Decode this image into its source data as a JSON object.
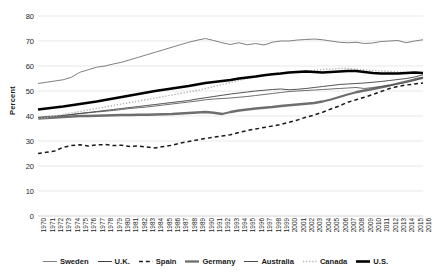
{
  "chart_data": {
    "type": "line",
    "title": "",
    "xlabel": "",
    "ylabel": "Percent",
    "ylim": [
      0,
      80
    ],
    "ytick_step": 10,
    "yticks": [
      0,
      10,
      20,
      30,
      40,
      50,
      60,
      70,
      80
    ],
    "grid": "horizontal",
    "legend_position": "bottom",
    "x": [
      1970,
      1971,
      1972,
      1973,
      1974,
      1975,
      1976,
      1977,
      1978,
      1979,
      1980,
      1981,
      1982,
      1983,
      1984,
      1985,
      1986,
      1987,
      1988,
      1989,
      1990,
      1991,
      1992,
      1993,
      1994,
      1995,
      1996,
      1997,
      1998,
      1999,
      2000,
      2001,
      2002,
      2003,
      2004,
      2005,
      2006,
      2007,
      2008,
      2009,
      2010,
      2011,
      2012,
      2013,
      2014,
      2015,
      2016
    ],
    "categories": [
      "1970",
      "1971",
      "1972",
      "1973",
      "1974",
      "1975",
      "1976",
      "1977",
      "1978",
      "1979",
      "1980",
      "1981",
      "1982",
      "1983",
      "1984",
      "1985",
      "1986",
      "1987",
      "1988",
      "1989",
      "1990",
      "1991",
      "1992",
      "1993",
      "1994",
      "1995",
      "1996",
      "1997",
      "1998",
      "1999",
      "2000",
      "2001",
      "2002",
      "2003",
      "2004",
      "2005",
      "2006",
      "2007",
      "2008",
      "2009",
      "2010",
      "2011",
      "2012",
      "2013",
      "2014",
      "2015",
      "2016"
    ],
    "series": [
      {
        "name": "Sweden",
        "color": "#808080",
        "style": "solid",
        "width": 1,
        "values": [
          53.0,
          53.5,
          54.0,
          54.5,
          55.5,
          57.5,
          58.5,
          59.5,
          60.0,
          60.8,
          61.5,
          62.5,
          63.5,
          64.5,
          65.5,
          66.5,
          67.5,
          68.5,
          69.5,
          70.3,
          71.0,
          70.2,
          69.3,
          68.6,
          69.3,
          68.5,
          69.0,
          68.4,
          69.5,
          70.0,
          70.0,
          70.4,
          70.6,
          70.8,
          70.5,
          70.0,
          69.5,
          69.3,
          69.5,
          69.0,
          69.2,
          69.8,
          70.0,
          70.2,
          69.3,
          70.0,
          70.5
        ]
      },
      {
        "name": "U.K.",
        "color": "#3f3f3f",
        "style": "solid",
        "width": 0.9,
        "values": [
          39.0,
          39.5,
          39.8,
          40.2,
          40.6,
          41.0,
          41.4,
          41.8,
          42.2,
          42.6,
          43.0,
          43.4,
          43.8,
          44.2,
          44.6,
          45.0,
          45.4,
          45.8,
          46.2,
          46.8,
          47.3,
          47.8,
          48.3,
          48.8,
          49.2,
          49.6,
          50.0,
          50.3,
          50.6,
          50.8,
          50.5,
          50.7,
          51.0,
          51.4,
          51.8,
          52.2,
          52.6,
          52.8,
          53.0,
          53.2,
          53.5,
          53.8,
          54.2,
          54.6,
          55.0,
          55.6,
          56.5
        ]
      },
      {
        "name": "Spain",
        "color": "#1a1a1a",
        "style": "dashed",
        "width": 1.5,
        "values": [
          25.0,
          25.5,
          26.0,
          27.5,
          28.2,
          28.5,
          28.0,
          28.4,
          28.6,
          28.2,
          28.3,
          27.8,
          28.0,
          27.6,
          27.2,
          27.8,
          28.3,
          29.2,
          29.8,
          30.4,
          31.0,
          31.5,
          32.0,
          32.5,
          33.4,
          34.2,
          34.8,
          35.4,
          36.0,
          36.6,
          37.5,
          38.4,
          39.5,
          40.4,
          41.5,
          42.8,
          44.0,
          45.5,
          46.5,
          47.5,
          48.6,
          49.8,
          51.0,
          51.8,
          52.4,
          52.8,
          53.2
        ]
      },
      {
        "name": "Germany",
        "color": "#6e6e6e",
        "style": "solid",
        "width": 2.3,
        "values": [
          39.0,
          39.2,
          39.4,
          39.6,
          39.8,
          40.0,
          40.0,
          40.1,
          40.2,
          40.3,
          40.4,
          40.4,
          40.5,
          40.5,
          40.6,
          40.7,
          40.8,
          41.0,
          41.2,
          41.4,
          41.6,
          41.3,
          40.8,
          41.6,
          42.2,
          42.6,
          43.0,
          43.3,
          43.6,
          44.0,
          44.3,
          44.6,
          44.9,
          45.2,
          45.8,
          46.6,
          47.6,
          48.6,
          49.5,
          50.2,
          50.8,
          51.5,
          52.2,
          53.0,
          53.8,
          54.6,
          55.3
        ]
      },
      {
        "name": "Australia",
        "color": "#4a4a4a",
        "style": "solid",
        "width": 0.8,
        "values": [
          39.5,
          39.8,
          40.0,
          40.2,
          40.6,
          41.0,
          41.3,
          41.6,
          41.9,
          42.2,
          42.6,
          43.0,
          43.3,
          43.6,
          44.0,
          44.4,
          44.8,
          45.2,
          45.6,
          46.0,
          46.5,
          46.8,
          47.0,
          47.2,
          47.5,
          47.8,
          48.2,
          48.6,
          49.0,
          49.4,
          49.8,
          50.0,
          50.2,
          50.4,
          50.6,
          50.8,
          51.0,
          51.2,
          51.4,
          51.0,
          51.4,
          51.8,
          52.2,
          52.8,
          53.4,
          54.2,
          55.5
        ]
      },
      {
        "name": "Canada",
        "color": "#b0b0b0",
        "style": "dotted",
        "width": 1.4,
        "values": [
          38.8,
          39.4,
          40.0,
          40.6,
          41.2,
          41.8,
          42.4,
          43.0,
          43.6,
          44.2,
          44.8,
          45.4,
          46.0,
          46.6,
          47.2,
          47.8,
          48.4,
          49.0,
          49.6,
          50.2,
          51.0,
          51.8,
          52.6,
          53.4,
          54.2,
          55.0,
          55.6,
          56.2,
          56.8,
          57.2,
          57.6,
          57.8,
          58.0,
          58.2,
          58.6,
          58.8,
          59.0,
          59.0,
          58.8,
          58.4,
          58.2,
          58.0,
          57.8,
          57.6,
          57.4,
          57.6,
          57.0
        ]
      },
      {
        "name": "U.S.",
        "color": "#000000",
        "style": "solid",
        "width": 2.6,
        "values": [
          42.6,
          43.0,
          43.4,
          43.8,
          44.3,
          44.8,
          45.3,
          45.8,
          46.4,
          47.0,
          47.6,
          48.2,
          48.8,
          49.4,
          50.0,
          50.5,
          51.0,
          51.5,
          52.0,
          52.6,
          53.2,
          53.6,
          54.0,
          54.4,
          55.0,
          55.4,
          55.8,
          56.3,
          56.7,
          57.0,
          57.4,
          57.6,
          57.8,
          57.6,
          57.4,
          57.6,
          57.8,
          58.0,
          58.0,
          57.6,
          57.2,
          57.0,
          57.0,
          57.0,
          57.2,
          57.4,
          57.2
        ]
      }
    ]
  }
}
